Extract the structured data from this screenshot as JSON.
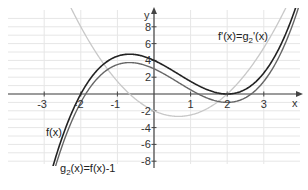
{
  "chart_data": {
    "type": "line",
    "title": "",
    "xlabel": "x",
    "ylabel": "y",
    "xlim": [
      -4,
      4
    ],
    "ylim": [
      -10,
      10
    ],
    "grid": true,
    "x_ticks": [
      -3,
      -2,
      -1,
      1,
      2,
      3
    ],
    "y_ticks": [
      8,
      6,
      4,
      2,
      -2,
      -4,
      -6,
      -8
    ],
    "series": [
      {
        "name": "f(x)",
        "formula": "0.5*(x+2)*(x-2)^2",
        "x": [
          -2.3,
          -2,
          -1.5,
          -1,
          -0.67,
          0,
          0.5,
          1,
          1.5,
          2,
          2.5,
          3,
          3.4
        ],
        "values": [
          -2.97,
          0,
          3.06,
          4.5,
          4.74,
          4,
          2.81,
          1.5,
          0.44,
          0,
          0.56,
          2.5,
          5.29
        ],
        "color": "#222222"
      },
      {
        "name": "g2(x) = f(x)-1",
        "formula": "0.5*(x+2)*(x-2)^2 - 1",
        "x": [
          -2.3,
          -2,
          -1.5,
          -1,
          -0.67,
          0,
          0.5,
          1,
          1.5,
          2,
          2.5,
          3,
          3.5
        ],
        "values": [
          -3.97,
          -1,
          2.06,
          3.5,
          3.74,
          3,
          1.81,
          0.5,
          -0.56,
          -1,
          -0.44,
          1.5,
          5.19
        ],
        "color": "#666666"
      },
      {
        "name": "f'(x) = g2'(x)",
        "formula": "0.5*(x-2)*(3x+2)",
        "x": [
          -1,
          -0.67,
          0,
          0.67,
          1,
          1.5,
          2,
          2.5,
          3
        ],
        "values": [
          4.5,
          2.67,
          -2,
          -2.67,
          -2.5,
          -1.63,
          0,
          2.38,
          5.5
        ],
        "color": "#c8c8c8"
      }
    ],
    "annotations": [
      "f'(x)=g2'(x)",
      "f(x)",
      "g2(x)=f(x)-1"
    ]
  },
  "labels": {
    "x_axis": "x",
    "y_axis": "y",
    "derivative": "f'(x)=g",
    "derivative_sub": "2",
    "derivative_end": "'(x)",
    "f": "f(x)",
    "g2_prefix": "g",
    "g2_sub": "2",
    "g2_rest": "(x)=f(x)-1",
    "x_ticks": [
      "-3",
      "-2",
      "-1",
      "1",
      "2",
      "3"
    ],
    "y_ticks": [
      "8",
      "6",
      "4",
      "2",
      "-2",
      "-4",
      "-6",
      "-8"
    ]
  }
}
